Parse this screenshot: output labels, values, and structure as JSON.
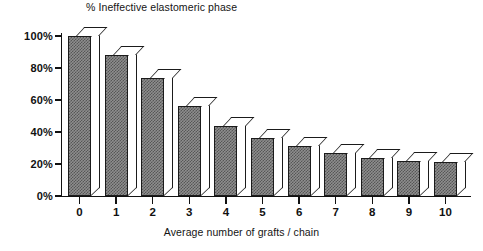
{
  "chart_data": {
    "type": "bar",
    "title": "% Ineffective elastomeric phase",
    "xlabel": "Average number of grafts / chain",
    "ylabel": "",
    "categories": [
      "0",
      "1",
      "2",
      "3",
      "4",
      "5",
      "6",
      "7",
      "8",
      "9",
      "10"
    ],
    "values": [
      100,
      88,
      74,
      56,
      44,
      36,
      31,
      27,
      24,
      22,
      21
    ],
    "ylim": [
      0,
      100
    ],
    "yticks": [
      0,
      20,
      40,
      60,
      80,
      100
    ],
    "ytick_labels": [
      "0%",
      "20%",
      "40%",
      "60%",
      "80%",
      "100%"
    ],
    "grid": false,
    "legend": null,
    "style": "3d-bar",
    "bar_fill_color": "#8e8e8e",
    "bar_edge_color": "#1b1b1b",
    "background_color": "#ffffff"
  }
}
